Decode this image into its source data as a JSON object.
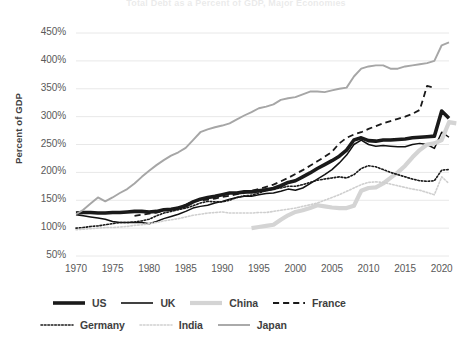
{
  "chart_data": {
    "type": "line",
    "title": "Total Debt as a Percent of GDP, Major Economies",
    "xlabel": "",
    "ylabel": "Percent of GDP",
    "xlim": [
      1970,
      2021
    ],
    "ylim": [
      50,
      450
    ],
    "ytick_labels": [
      "450%",
      "400%",
      "350%",
      "300%",
      "250%",
      "200%",
      "150%",
      "100%",
      "50%"
    ],
    "ytick_values": [
      450,
      400,
      350,
      300,
      250,
      200,
      150,
      100,
      50
    ],
    "xtick_labels": [
      "1970",
      "1975",
      "1980",
      "1985",
      "1990",
      "1995",
      "2000",
      "2005",
      "2010",
      "2015",
      "2020"
    ],
    "xtick_values": [
      1970,
      1975,
      1980,
      1985,
      1990,
      1995,
      2000,
      2005,
      2010,
      2015,
      2020
    ],
    "grid": "horizontal",
    "legend_position": "bottom",
    "series": [
      {
        "name": "US",
        "color": "#1a1a1a",
        "style": "solid",
        "width": 3.6,
        "x_start": 1970,
        "values": [
          127,
          128,
          128,
          127,
          127,
          128,
          128,
          129,
          130,
          130,
          129,
          130,
          133,
          134,
          136,
          140,
          147,
          152,
          155,
          157,
          160,
          163,
          163,
          165,
          165,
          167,
          169,
          171,
          176,
          182,
          185,
          192,
          199,
          207,
          214,
          221,
          229,
          240,
          258,
          262,
          257,
          256,
          258,
          258,
          259,
          260,
          262,
          263,
          264,
          265,
          310,
          297
        ]
      },
      {
        "name": "UK",
        "color": "#111111",
        "style": "solid",
        "width": 1.5,
        "x_start": 1970,
        "values": [
          124,
          122,
          120,
          118,
          116,
          112,
          110,
          110,
          110,
          110,
          108,
          112,
          117,
          121,
          125,
          130,
          136,
          139,
          141,
          145,
          148,
          152,
          155,
          157,
          157,
          160,
          162,
          163,
          166,
          170,
          168,
          172,
          180,
          188,
          196,
          205,
          217,
          231,
          250,
          258,
          250,
          247,
          248,
          247,
          246,
          246,
          250,
          252,
          250,
          243,
          272,
          263
        ]
      },
      {
        "name": "China",
        "color": "#d4d4d4",
        "style": "solid",
        "width": 4.2,
        "x_start": 1994,
        "values": [
          100,
          102,
          104,
          106,
          115,
          123,
          129,
          132,
          136,
          141,
          139,
          137,
          136,
          136,
          140,
          167,
          172,
          173,
          180,
          190,
          200,
          212,
          227,
          240,
          250,
          252,
          258,
          290,
          288
        ]
      },
      {
        "name": "France",
        "color": "#1a1a1a",
        "style": "dashed",
        "width": 1.8,
        "x_start": 1978,
        "values": [
          122,
          124,
          126,
          128,
          131,
          134,
          137,
          142,
          148,
          150,
          151,
          153,
          156,
          158,
          161,
          163,
          167,
          170,
          174,
          178,
          184,
          190,
          197,
          204,
          212,
          220,
          228,
          237,
          252,
          262,
          268,
          272,
          278,
          283,
          288,
          292,
          296,
          300,
          305,
          312,
          355,
          352
        ]
      },
      {
        "name": "Germany",
        "color": "#1a1a1a",
        "style": "dotted",
        "width": 1.6,
        "x_start": 1970,
        "values": [
          100,
          101,
          103,
          104,
          106,
          108,
          110,
          110,
          111,
          113,
          116,
          122,
          127,
          130,
          133,
          136,
          140,
          145,
          148,
          147,
          147,
          150,
          155,
          158,
          159,
          163,
          167,
          170,
          172,
          175,
          175,
          178,
          182,
          186,
          188,
          190,
          192,
          190,
          196,
          207,
          212,
          210,
          205,
          200,
          196,
          192,
          188,
          185,
          184,
          185,
          204,
          205
        ]
      },
      {
        "name": "India",
        "color": "#cfcfcf",
        "style": "dotted",
        "width": 1.6,
        "x_start": 1970,
        "values": [
          97,
          98,
          99,
          100,
          101,
          101,
          102,
          103,
          105,
          106,
          108,
          110,
          113,
          115,
          117,
          120,
          123,
          125,
          127,
          128,
          129,
          127,
          127,
          127,
          127,
          128,
          128,
          130,
          132,
          134,
          136,
          139,
          142,
          145,
          150,
          155,
          160,
          166,
          172,
          178,
          182,
          183,
          182,
          179,
          176,
          173,
          170,
          168,
          164,
          160,
          192,
          180
        ]
      },
      {
        "name": "Japan",
        "color": "#a6a6a6",
        "style": "solid",
        "width": 1.9,
        "x_start": 1970,
        "values": [
          125,
          133,
          144,
          155,
          148,
          155,
          163,
          170,
          180,
          192,
          203,
          213,
          222,
          230,
          236,
          244,
          258,
          272,
          277,
          281,
          284,
          288,
          295,
          302,
          308,
          315,
          318,
          322,
          330,
          333,
          335,
          340,
          345,
          345,
          344,
          347,
          350,
          352,
          372,
          386,
          390,
          392,
          392,
          386,
          386,
          390,
          392,
          394,
          396,
          400,
          428,
          433
        ]
      }
    ]
  }
}
